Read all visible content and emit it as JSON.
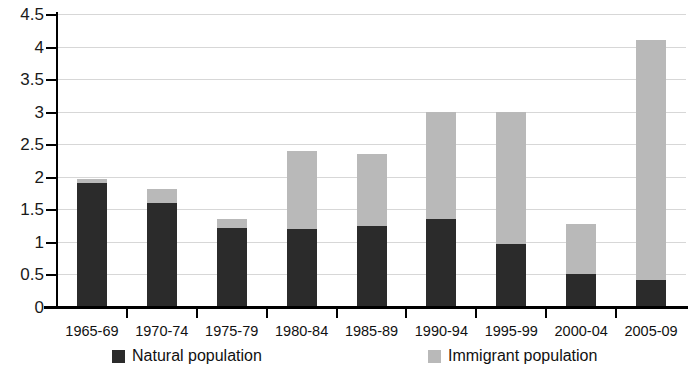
{
  "chart_data": {
    "type": "bar",
    "title": "",
    "subtitle": "",
    "xlabel": "",
    "ylabel": "",
    "stacked": true,
    "grid": true,
    "legend_position": "bottom",
    "ylim": [
      0,
      4.5
    ],
    "ytick_step": 0.5,
    "categories": [
      "1965-69",
      "1970-74",
      "1975-79",
      "1980-84",
      "1985-89",
      "1990-94",
      "1995-99",
      "2000-04",
      "2005-09"
    ],
    "ytick_labels": [
      "0",
      "0.5",
      "1",
      "1.5",
      "2",
      "2.5",
      "3",
      "3.5",
      "4",
      "4.5"
    ],
    "ytick_values": [
      0,
      0.5,
      1,
      1.5,
      2,
      2.5,
      3,
      3.5,
      4,
      4.5
    ],
    "series": [
      {
        "name": "Natural population",
        "color": "#2b2b2b",
        "values": [
          1.9,
          1.6,
          1.22,
          1.2,
          1.25,
          1.35,
          0.97,
          0.51,
          0.42
        ]
      },
      {
        "name": "Immigrant population",
        "color": "#b9b9b9",
        "values": [
          0.07,
          0.22,
          0.13,
          1.2,
          1.1,
          1.65,
          2.03,
          0.76,
          3.68
        ]
      }
    ],
    "totals": [
      1.97,
      1.82,
      1.35,
      2.4,
      2.35,
      3.0,
      3.0,
      1.27,
      4.1
    ]
  },
  "legend": {
    "items": [
      {
        "label": "Natural population",
        "color": "#2b2b2b"
      },
      {
        "label": "Immigrant population",
        "color": "#b9b9b9"
      }
    ]
  }
}
